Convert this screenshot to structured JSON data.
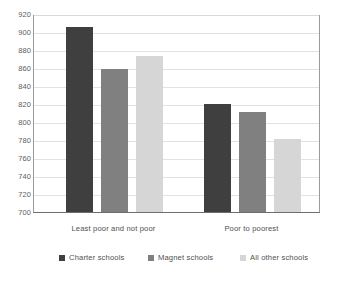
{
  "chart_data": {
    "type": "bar",
    "title": "",
    "subtitle": "",
    "xlabel": "",
    "ylabel": "",
    "ylim": [
      700,
      920
    ],
    "ytick_step": 20,
    "yticks": [
      920,
      900,
      880,
      860,
      840,
      820,
      800,
      780,
      760,
      740,
      720,
      700
    ],
    "ytick_labels": [
      "920",
      "900",
      "880",
      "860",
      "840",
      "820",
      "800",
      "780",
      "760",
      "740",
      "720",
      "700"
    ],
    "categories": [
      "Least poor and not poor",
      "Poor to poorest"
    ],
    "grid": "horizontal",
    "legend_position": "bottom",
    "series": [
      {
        "name": "Charter schools",
        "color": "#3f3f3f",
        "values": [
          906,
          820
        ]
      },
      {
        "name": "Magnet schools",
        "color": "#808080",
        "values": [
          859,
          811
        ]
      },
      {
        "name": "All other schools",
        "color": "#d6d6d6",
        "values": [
          873,
          781
        ]
      }
    ]
  },
  "axis": {
    "baseline_color": "#6e6e6e",
    "gridline_color": "#e2e2e2"
  },
  "legend": {
    "items": [
      {
        "label": "Charter schools",
        "color": "#3f3f3f"
      },
      {
        "label": "Magnet schools",
        "color": "#808080"
      },
      {
        "label": "All other schools",
        "color": "#d6d6d6"
      }
    ]
  }
}
